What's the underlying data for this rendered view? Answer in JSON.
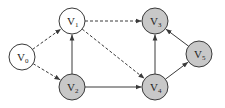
{
  "diagram": {
    "type": "directed-graph",
    "colors": {
      "unvisited_fill": "#ffffff",
      "visited_fill": "#c8c8c8",
      "stroke": "#3a3a3a"
    },
    "nodes": [
      {
        "id": "v0",
        "letter": "V",
        "sub": "0",
        "x": 22,
        "y": 57,
        "filled": false
      },
      {
        "id": "v1",
        "letter": "V",
        "sub": "1",
        "x": 72,
        "y": 21,
        "filled": false
      },
      {
        "id": "v2",
        "letter": "V",
        "sub": "2",
        "x": 72,
        "y": 87,
        "filled": true
      },
      {
        "id": "v3",
        "letter": "V",
        "sub": "3",
        "x": 155,
        "y": 21,
        "filled": true
      },
      {
        "id": "v4",
        "letter": "V",
        "sub": "4",
        "x": 155,
        "y": 87,
        "filled": true
      },
      {
        "id": "v5",
        "letter": "V",
        "sub": "5",
        "x": 199,
        "y": 54,
        "filled": true
      }
    ],
    "edges": [
      {
        "from": "v0",
        "to": "v1",
        "style": "dashed"
      },
      {
        "from": "v0",
        "to": "v2",
        "style": "dashed"
      },
      {
        "from": "v1",
        "to": "v3",
        "style": "dashed"
      },
      {
        "from": "v1",
        "to": "v4",
        "style": "dashed"
      },
      {
        "from": "v2",
        "to": "v1",
        "style": "solid"
      },
      {
        "from": "v2",
        "to": "v4",
        "style": "solid"
      },
      {
        "from": "v4",
        "to": "v3",
        "style": "solid"
      },
      {
        "from": "v4",
        "to": "v5",
        "style": "solid"
      },
      {
        "from": "v5",
        "to": "v3",
        "style": "solid"
      }
    ]
  }
}
